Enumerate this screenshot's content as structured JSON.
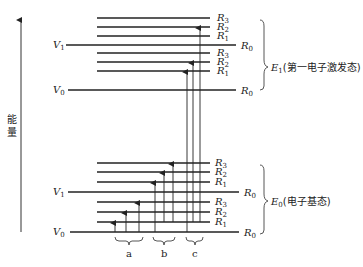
{
  "axis": {
    "label": "能量"
  },
  "upper_state": {
    "label": "E",
    "sub": "1",
    "desc": "(第一电子激发态)",
    "v_labels": [
      {
        "name": "V",
        "sub": "1"
      },
      {
        "name": "V",
        "sub": "0"
      }
    ],
    "levels": [
      {
        "y": 18,
        "label": "R",
        "sub": "3",
        "long": false
      },
      {
        "y": 27,
        "label": "R",
        "sub": "2",
        "long": false
      },
      {
        "y": 36,
        "label": "R",
        "sub": "1",
        "long": false
      },
      {
        "y": 45,
        "label": "R",
        "sub": "0",
        "long": true,
        "v": "V1"
      },
      {
        "y": 53,
        "label": "R",
        "sub": "3",
        "long": false
      },
      {
        "y": 62,
        "label": "R",
        "sub": "2",
        "long": false
      },
      {
        "y": 71,
        "label": "R",
        "sub": "1",
        "long": false
      },
      {
        "y": 90,
        "label": "R",
        "sub": "0",
        "long": true,
        "v": "V0"
      }
    ]
  },
  "lower_state": {
    "label": "E",
    "sub": "0",
    "desc": "(电子基态)",
    "levels": [
      {
        "y": 163,
        "label": "R",
        "sub": "3",
        "long": false
      },
      {
        "y": 172,
        "label": "R",
        "sub": "2",
        "long": false
      },
      {
        "y": 182,
        "label": "R",
        "sub": "1",
        "long": false
      },
      {
        "y": 192,
        "label": "R",
        "sub": "0",
        "long": true,
        "v": "V1"
      },
      {
        "y": 202,
        "label": "R",
        "sub": "3",
        "long": false
      },
      {
        "y": 212,
        "label": "R",
        "sub": "2",
        "long": false
      },
      {
        "y": 222,
        "label": "R",
        "sub": "1",
        "long": false
      },
      {
        "y": 232,
        "label": "R",
        "sub": "0",
        "long": true,
        "v": "V0"
      }
    ]
  },
  "groups": [
    {
      "label": "a",
      "desc": "rotational transitions"
    },
    {
      "label": "b",
      "desc": "vibrational-rotational transitions"
    },
    {
      "label": "c",
      "desc": "electronic transitions"
    }
  ]
}
